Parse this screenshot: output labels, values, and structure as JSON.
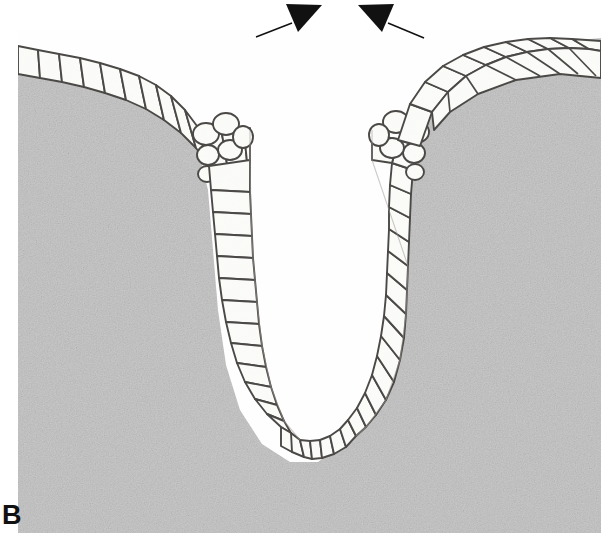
{
  "figure": {
    "panel_label": "B",
    "type": "histological-micrograph",
    "background_color": "#ffffff",
    "tissue_fill_color": "#c9c9c9",
    "lumen_color": "#ffffff",
    "cell_fill_color": "#fbfbf8",
    "cell_outline_color": "#4a4744",
    "annotation_color": "#111111"
  },
  "frame": {
    "left": 18,
    "top": 38,
    "right": 601,
    "bottom": 533,
    "width": 583,
    "height": 495
  },
  "annotations": {
    "arrowheads": [
      {
        "name": "left-arrowhead",
        "label": "",
        "tail_x": 256,
        "tail_y": 37,
        "tip_x": 288,
        "tip_y": 25,
        "direction": "up-right"
      },
      {
        "name": "right-arrowhead",
        "label": "",
        "tail_x": 424,
        "tail_y": 38,
        "tip_x": 390,
        "tip_y": 25,
        "direction": "up-left"
      }
    ],
    "arrow_count": 2,
    "arrow_meaning": "markers indicating the furrow opening / apical constriction site"
  },
  "structure": {
    "left_epithelium_cell_count": 34,
    "right_epithelium_cell_count": 34,
    "basal_wedge_cell_count": 14,
    "description": "Columnar epithelial sheet folded into a deep U-shaped invagination; apical surfaces line the central lumen, basal surfaces abut the gray underlying tissue."
  }
}
